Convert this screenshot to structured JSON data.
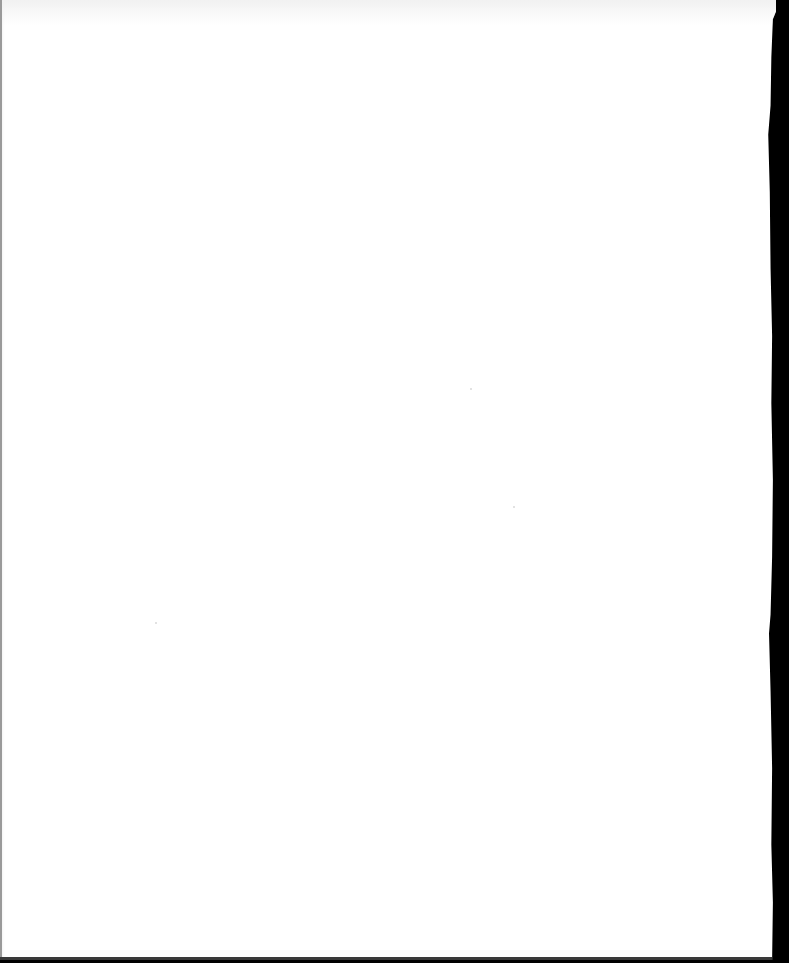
{
  "document": {
    "type": "scanned-page",
    "content": "",
    "page_color": "#ffffff",
    "scanner_background_color": "#000000"
  }
}
